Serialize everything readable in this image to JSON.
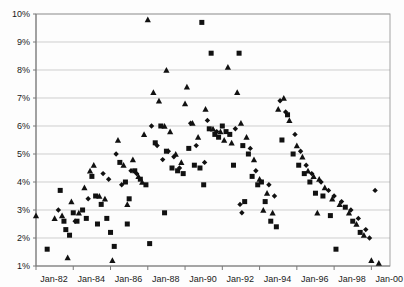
{
  "chart_data": {
    "type": "scatter",
    "title": "",
    "subtitle": "",
    "xlabel": "",
    "ylabel": "",
    "grid": true,
    "legend_position": "none",
    "xlim": [
      "Jan-82",
      "Jan-01"
    ],
    "ylim": [
      1,
      10
    ],
    "y_tick_labels": [
      "10%",
      "9%",
      "8%",
      "7%",
      "6%",
      "5%",
      "4%",
      "3%",
      "2%",
      "1%"
    ],
    "y_tick_values": [
      10,
      9,
      8,
      7,
      6,
      5,
      4,
      3,
      2,
      1
    ],
    "y_unit": "%",
    "x_tick_labels": [
      "Jan-82",
      "Jan-84",
      "Jan-86",
      "Jan-88",
      "Jan-90",
      "Jan-92",
      "Jan-94",
      "Jan-96",
      "Jan-98",
      "Jan-00"
    ],
    "x_tick_values": [
      1982,
      1984,
      1986,
      1988,
      1990,
      1992,
      1994,
      1996,
      1998,
      2000
    ],
    "marker_color": "#111111",
    "series": [
      {
        "name": "series-square",
        "marker": "square",
        "points": [
          [
            1982.6,
            1.6
          ],
          [
            1983.3,
            3.7
          ],
          [
            1983.5,
            2.6
          ],
          [
            1983.6,
            2.3
          ],
          [
            1983.8,
            2.1
          ],
          [
            1984.0,
            2.9
          ],
          [
            1984.2,
            2.6
          ],
          [
            1984.5,
            3.0
          ],
          [
            1984.7,
            2.7
          ],
          [
            1985.0,
            4.2
          ],
          [
            1985.2,
            3.5
          ],
          [
            1985.5,
            3.2
          ],
          [
            1985.8,
            2.7
          ],
          [
            1986.0,
            2.2
          ],
          [
            1986.2,
            1.7
          ],
          [
            1986.5,
            4.7
          ],
          [
            1986.8,
            4.0
          ],
          [
            1987.0,
            3.4
          ],
          [
            1987.3,
            4.4
          ],
          [
            1987.6,
            4.1
          ],
          [
            1987.9,
            3.9
          ],
          [
            1988.1,
            1.8
          ],
          [
            1988.4,
            5.4
          ],
          [
            1988.7,
            6.0
          ],
          [
            1989.0,
            5.1
          ],
          [
            1989.3,
            4.5
          ],
          [
            1989.6,
            4.4
          ],
          [
            1989.9,
            4.3
          ],
          [
            1990.2,
            5.2
          ],
          [
            1990.5,
            4.6
          ],
          [
            1990.8,
            4.5
          ],
          [
            1991.0,
            3.9
          ],
          [
            1991.3,
            5.9
          ],
          [
            1991.6,
            5.7
          ],
          [
            1991.8,
            5.6
          ],
          [
            1992.0,
            6.0
          ],
          [
            1992.2,
            5.8
          ],
          [
            1992.4,
            5.7
          ],
          [
            1992.6,
            4.6
          ],
          [
            1992.9,
            8.6
          ],
          [
            1993.1,
            5.3
          ],
          [
            1993.4,
            5.0
          ],
          [
            1993.6,
            4.2
          ],
          [
            1993.9,
            3.9
          ],
          [
            1994.1,
            4.0
          ],
          [
            1994.3,
            3.3
          ],
          [
            1994.6,
            2.6
          ],
          [
            1994.9,
            2.4
          ],
          [
            1995.2,
            5.5
          ],
          [
            1995.5,
            6.4
          ],
          [
            1995.8,
            5.0
          ],
          [
            1996.1,
            4.6
          ],
          [
            1996.4,
            4.3
          ],
          [
            1996.7,
            4.0
          ],
          [
            1997.0,
            3.6
          ],
          [
            1997.4,
            3.5
          ],
          [
            1997.8,
            2.8
          ],
          [
            1998.1,
            1.6
          ],
          [
            1998.6,
            3.1
          ],
          [
            1999.0,
            2.6
          ],
          [
            1999.4,
            2.2
          ],
          [
            1990.9,
            9.7
          ],
          [
            1991.4,
            8.6
          ],
          [
            1988.9,
            2.9
          ],
          [
            1986.9,
            2.5
          ],
          [
            1985.3,
            2.5
          ],
          [
            1993.2,
            3.3
          ]
        ]
      },
      {
        "name": "series-triangle",
        "marker": "triangle",
        "points": [
          [
            1982.0,
            2.8
          ],
          [
            1983.0,
            2.7
          ],
          [
            1983.4,
            2.8
          ],
          [
            1983.7,
            1.3
          ],
          [
            1983.9,
            3.3
          ],
          [
            1984.3,
            2.9
          ],
          [
            1984.6,
            3.8
          ],
          [
            1984.9,
            4.4
          ],
          [
            1985.1,
            4.6
          ],
          [
            1985.4,
            3.5
          ],
          [
            1985.7,
            3.4
          ],
          [
            1986.1,
            1.2
          ],
          [
            1986.4,
            5.5
          ],
          [
            1986.7,
            4.6
          ],
          [
            1986.9,
            3.2
          ],
          [
            1987.2,
            4.8
          ],
          [
            1987.5,
            4.2
          ],
          [
            1987.7,
            4.0
          ],
          [
            1988.0,
            9.8
          ],
          [
            1988.3,
            7.2
          ],
          [
            1988.6,
            6.9
          ],
          [
            1988.9,
            6.0
          ],
          [
            1989.2,
            5.8
          ],
          [
            1989.5,
            5.0
          ],
          [
            1989.8,
            4.7
          ],
          [
            1990.1,
            7.4
          ],
          [
            1990.4,
            6.1
          ],
          [
            1990.7,
            5.6
          ],
          [
            1991.1,
            6.6
          ],
          [
            1991.5,
            5.9
          ],
          [
            1991.9,
            5.8
          ],
          [
            1992.1,
            5.5
          ],
          [
            1992.5,
            5.4
          ],
          [
            1992.8,
            7.2
          ],
          [
            1993.0,
            6.1
          ],
          [
            1993.3,
            5.6
          ],
          [
            1993.7,
            4.8
          ],
          [
            1994.0,
            4.1
          ],
          [
            1994.4,
            3.6
          ],
          [
            1994.7,
            2.9
          ],
          [
            1995.0,
            6.6
          ],
          [
            1995.3,
            7.0
          ],
          [
            1995.6,
            6.2
          ],
          [
            1996.0,
            5.3
          ],
          [
            1996.3,
            4.9
          ],
          [
            1996.6,
            4.4
          ],
          [
            1996.9,
            4.2
          ],
          [
            1997.2,
            4.1
          ],
          [
            1997.5,
            3.8
          ],
          [
            1997.9,
            3.4
          ],
          [
            1998.3,
            3.2
          ],
          [
            1998.8,
            2.9
          ],
          [
            1999.2,
            2.5
          ],
          [
            1999.6,
            2.1
          ],
          [
            2000.0,
            1.2
          ],
          [
            2000.4,
            1.1
          ],
          [
            1992.3,
            8.1
          ],
          [
            1989.0,
            8.0
          ],
          [
            1990.0,
            6.8
          ],
          [
            1994.2,
            3.0
          ],
          [
            1997.1,
            2.9
          ],
          [
            1987.8,
            5.7
          ]
        ]
      },
      {
        "name": "series-diamond",
        "marker": "diamond",
        "points": [
          [
            1983.2,
            3.0
          ],
          [
            1984.1,
            2.6
          ],
          [
            1984.8,
            3.4
          ],
          [
            1985.6,
            4.3
          ],
          [
            1986.3,
            5.0
          ],
          [
            1986.6,
            3.9
          ],
          [
            1987.1,
            4.4
          ],
          [
            1987.4,
            4.3
          ],
          [
            1988.2,
            6.0
          ],
          [
            1988.5,
            5.3
          ],
          [
            1989.1,
            5.1
          ],
          [
            1989.4,
            4.9
          ],
          [
            1989.7,
            4.5
          ],
          [
            1990.3,
            6.1
          ],
          [
            1990.6,
            5.3
          ],
          [
            1991.2,
            6.2
          ],
          [
            1991.7,
            5.8
          ],
          [
            1992.7,
            5.9
          ],
          [
            1993.5,
            5.2
          ],
          [
            1993.8,
            4.4
          ],
          [
            1994.5,
            3.9
          ],
          [
            1994.8,
            3.5
          ],
          [
            1995.1,
            6.9
          ],
          [
            1995.4,
            6.5
          ],
          [
            1995.9,
            5.7
          ],
          [
            1996.2,
            5.1
          ],
          [
            1996.5,
            4.6
          ],
          [
            1996.8,
            4.3
          ],
          [
            1997.3,
            4.0
          ],
          [
            1997.7,
            3.7
          ],
          [
            1998.0,
            3.5
          ],
          [
            1998.4,
            3.3
          ],
          [
            1998.9,
            3.0
          ],
          [
            1999.3,
            2.7
          ],
          [
            1999.7,
            2.3
          ],
          [
            2000.2,
            3.7
          ],
          [
            1999.9,
            2.0
          ],
          [
            1992.95,
            3.2
          ],
          [
            1993.05,
            2.9
          ],
          [
            1985.9,
            4.1
          ],
          [
            1988.8,
            4.8
          ],
          [
            1991.05,
            4.7
          ]
        ]
      }
    ]
  }
}
